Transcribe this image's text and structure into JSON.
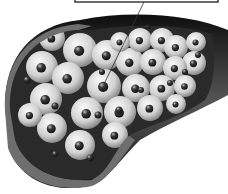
{
  "figure": {
    "label_box": {
      "text": "",
      "border_color": "#3a3a3a"
    },
    "pointer": {
      "x1": 144,
      "y1": 2,
      "x2": 105,
      "y2": 82
    },
    "colors": {
      "background": "#ffffff",
      "wall_outer": "#1a1a1a",
      "wall_cut": "#6e6e6e",
      "lumen": "#2a2a2a",
      "cell_light": "#f4f4f4",
      "cell_dark": "#8c8c8c",
      "nucleus": "#2e2e2e"
    },
    "cells": [
      {
        "x": 52,
        "y": 38,
        "r": 13
      },
      {
        "x": 80,
        "y": 50,
        "r": 17
      },
      {
        "x": 42,
        "y": 67,
        "r": 16
      },
      {
        "x": 68,
        "y": 78,
        "r": 16
      },
      {
        "x": 46,
        "y": 99,
        "r": 16
      },
      {
        "x": 107,
        "y": 55,
        "r": 15
      },
      {
        "x": 130,
        "y": 62,
        "r": 14
      },
      {
        "x": 104,
        "y": 86,
        "r": 17
      },
      {
        "x": 140,
        "y": 40,
        "r": 12
      },
      {
        "x": 162,
        "y": 40,
        "r": 12
      },
      {
        "x": 153,
        "y": 62,
        "r": 13
      },
      {
        "x": 176,
        "y": 47,
        "r": 12
      },
      {
        "x": 196,
        "y": 42,
        "r": 10
      },
      {
        "x": 194,
        "y": 63,
        "r": 12
      },
      {
        "x": 175,
        "y": 68,
        "r": 12
      },
      {
        "x": 162,
        "y": 88,
        "r": 13
      },
      {
        "x": 185,
        "y": 86,
        "r": 11
      },
      {
        "x": 136,
        "y": 88,
        "r": 14
      },
      {
        "x": 87,
        "y": 113,
        "r": 16
      },
      {
        "x": 120,
        "y": 112,
        "r": 16
      },
      {
        "x": 150,
        "y": 108,
        "r": 13
      },
      {
        "x": 176,
        "y": 104,
        "r": 10
      },
      {
        "x": 52,
        "y": 128,
        "r": 15
      },
      {
        "x": 80,
        "y": 145,
        "r": 15
      },
      {
        "x": 115,
        "y": 135,
        "r": 13
      },
      {
        "x": 30,
        "y": 115,
        "r": 12
      },
      {
        "x": 120,
        "y": 42,
        "r": 10
      }
    ],
    "particles": [
      {
        "x": 27,
        "y": 80,
        "r": 3.5
      },
      {
        "x": 55,
        "y": 106,
        "r": 3.5
      },
      {
        "x": 98,
        "y": 115,
        "r": 3.5
      },
      {
        "x": 119,
        "y": 110,
        "r": 3.5
      },
      {
        "x": 90,
        "y": 158,
        "r": 3.5
      },
      {
        "x": 55,
        "y": 154,
        "r": 3
      },
      {
        "x": 102,
        "y": 72,
        "r": 3
      },
      {
        "x": 170,
        "y": 83,
        "r": 3
      },
      {
        "x": 198,
        "y": 55,
        "r": 3
      },
      {
        "x": 185,
        "y": 72,
        "r": 3
      },
      {
        "x": 141,
        "y": 90,
        "r": 3
      },
      {
        "x": 148,
        "y": 26,
        "r": 3
      }
    ]
  }
}
